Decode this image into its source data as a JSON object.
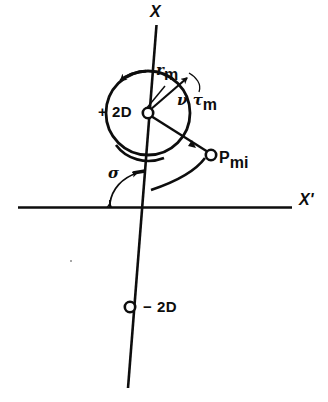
{
  "figure": {
    "kind": "physics-vector-diagram",
    "background_color": "#ffffff",
    "ink_color": "#0d0d0d",
    "width": 328,
    "height": 402
  },
  "axes": {
    "vertical": {
      "label": "X",
      "name": "tilted-axis-x",
      "top_point": [
        156,
        25
      ],
      "bottom_point": [
        128,
        388
      ],
      "label_position": [
        150,
        8
      ]
    },
    "horizontal": {
      "label": "X'",
      "name": "horizontal-axis-x-prime",
      "left_point": [
        18,
        207
      ],
      "right_point": [
        292,
        207
      ],
      "label_position": [
        300,
        196
      ]
    },
    "origin": [
      143,
      207
    ]
  },
  "circle": {
    "name": "rotation-circle",
    "center": [
      148,
      113
    ],
    "radius": 42,
    "rotation_sense": "counter-clockwise"
  },
  "nodes": [
    {
      "name": "node-center-plus-2d",
      "label": "+ 2D",
      "position": [
        148,
        113
      ],
      "label_position": [
        100,
        104
      ],
      "marker": "open-circle"
    },
    {
      "name": "node-p-mi",
      "label_base": "P",
      "label_sub": "mi",
      "position": [
        211,
        155
      ],
      "label_position": [
        219,
        152
      ],
      "marker": "open-circle"
    },
    {
      "name": "node-minus-2d",
      "label": "− 2D",
      "position": [
        130,
        307
      ],
      "label_position": [
        143,
        299
      ],
      "marker": "open-circle"
    }
  ],
  "annotations": [
    {
      "name": "radius-label-r-m",
      "base": "r",
      "sub": "m",
      "position": [
        157,
        68
      ],
      "description": "radius vector from center toward upper-right of circle"
    },
    {
      "name": "torque-label-nu-tau-m",
      "base": "ν τ",
      "sub": "m",
      "position": [
        180,
        96
      ],
      "description": "nu tau sub m, arc arrow on circle"
    },
    {
      "name": "angle-label-sigma",
      "base": "σ",
      "sub": "",
      "position": [
        111,
        172
      ],
      "description": "angle between X' axis and tilted X axis"
    }
  ],
  "arcs": [
    {
      "name": "sigma-angle-arc",
      "description": "double-headed curved arrow from horizontal axis up to tilted axis"
    },
    {
      "name": "sweep-arc-to-p-mi",
      "description": "large arc sweeping from lower-left up to P_mi"
    },
    {
      "name": "lower-arc-under-circle",
      "description": "short arc below the circle"
    }
  ],
  "artifacts": [
    {
      "name": "scan-speck",
      "position": [
        70,
        260
      ]
    }
  ]
}
